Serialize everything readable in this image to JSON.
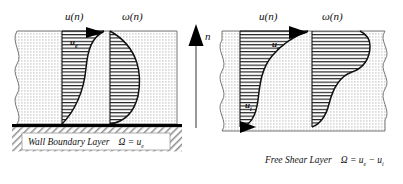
{
  "figure": {
    "type": "diagram",
    "axis": {
      "vertical_label": "n",
      "vertical_direction": "up"
    }
  },
  "panels": [
    {
      "id": "wall-boundary-layer",
      "position": "left",
      "caption": "Wall Boundary Layer",
      "equation": "Ω = u",
      "equation_subscript": "e",
      "profiles": [
        {
          "id": "velocity",
          "header": "u(n)",
          "header_symbol": "u",
          "header_arg": "(n)",
          "inner_label": "u",
          "inner_label_sub": "e",
          "shape": "boundary-layer-velocity",
          "arrow_top": true,
          "arrow_bottom": false,
          "description": "Velocity grows from zero at the wall to u_e at the edge"
        },
        {
          "id": "vorticity",
          "header": "ω(n)",
          "header_symbol": "ω",
          "header_arg": "(n)",
          "inner_label": "",
          "inner_label_sub": "",
          "shape": "boundary-layer-vorticity",
          "arrow_top": false,
          "arrow_bottom": false,
          "description": "Vorticity is maximum at the wall and decays to zero at the edge"
        }
      ]
    },
    {
      "id": "free-shear-layer",
      "position": "right",
      "caption": "Free Shear Layer",
      "equation": "Ω = u",
      "equation_subscript": "e",
      "equation_tail": " − u",
      "equation_subscript2": "i",
      "profiles": [
        {
          "id": "velocity",
          "header": "u(n)",
          "header_symbol": "u",
          "header_arg": "(n)",
          "inner_label": "u",
          "inner_label_sub": "e",
          "inner_label2": "u",
          "inner_label2_sub": "i",
          "shape": "shear-layer-velocity",
          "arrow_top": true,
          "arrow_bottom": true,
          "description": "S-shaped velocity varying from u_i below to u_e above"
        },
        {
          "id": "vorticity",
          "header": "ω(n)",
          "header_symbol": "ω",
          "header_arg": "(n)",
          "inner_label": "",
          "inner_label_sub": "",
          "shape": "shear-layer-vorticity",
          "arrow_top": false,
          "arrow_bottom": false,
          "description": "Bell-shaped vorticity peaking at the centre of the layer"
        }
      ]
    }
  ],
  "colors": {
    "ink": "#111111",
    "stipple": "#bdbdbd",
    "hatch": "#222222",
    "wall": "#000000",
    "background": "#ffffff"
  }
}
